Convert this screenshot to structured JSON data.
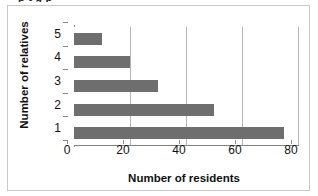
{
  "figure": {
    "clipped_top_text": "p         t         g  p",
    "border_color": "#c9c9c9",
    "background": "#ffffff"
  },
  "chart_data": {
    "type": "bar",
    "orientation": "horizontal",
    "title": "",
    "xlabel": "Number of residents",
    "ylabel": "Number of relatives",
    "categories": [
      "5",
      "4",
      "3",
      "2",
      "1"
    ],
    "values": [
      10,
      20,
      30,
      50,
      75
    ],
    "xlim": [
      0,
      80
    ],
    "xticks": [
      "0",
      "20",
      "40",
      "60",
      "80"
    ],
    "xtick_values": [
      0,
      20,
      40,
      60,
      80
    ],
    "grid": "vertical",
    "legend": "none",
    "bar_color": "#6e6e6e",
    "gridline_color": "#b4b4b4",
    "axis_color": "#808080"
  }
}
